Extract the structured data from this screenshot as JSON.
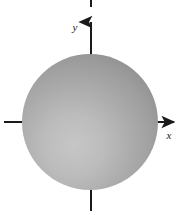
{
  "figure": {
    "background_color": "#ffffff",
    "width": 183,
    "height": 215
  },
  "axes": {
    "color": "#1a1a1a",
    "line_width": 2,
    "origin": {
      "x": 91,
      "y": 122
    },
    "x_axis": {
      "name": "x-axis",
      "label": "x",
      "label_position": {
        "x": 170,
        "y": 135
      },
      "arrow": "right",
      "left_stub": {
        "x1": 4,
        "y1": 122,
        "x2": 40,
        "y2": 122
      },
      "right_segment": {
        "x1": 140,
        "y1": 122,
        "x2": 176,
        "y2": 122
      }
    },
    "y_axis": {
      "name": "y-axis",
      "label": "y",
      "label_position": {
        "x": 78,
        "y": 27
      },
      "arrow": "up",
      "top_segment": {
        "x1": 91,
        "y1": 21,
        "x2": 91,
        "y2": 62
      },
      "bottom_stub": {
        "x1": 91,
        "y1": 182,
        "x2": 91,
        "y2": 211
      },
      "top_tick": {
        "x1": 91,
        "y1": 0,
        "x2": 91,
        "y2": 7
      }
    }
  },
  "sphere": {
    "name": "shaded-sphere",
    "center": {
      "x": 90,
      "y": 122
    },
    "radius": 68,
    "fill_light": "#bdbdbd",
    "fill_mid": "#a3a3a3",
    "fill_edge": "#8c8c8c",
    "highlight_center": {
      "x": 74,
      "y": 146
    },
    "outline_color": "#8a8a8a"
  }
}
